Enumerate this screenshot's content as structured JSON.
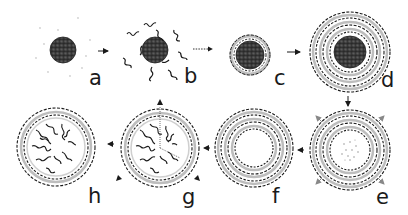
{
  "diagram": {
    "type": "process-sequence",
    "colors": {
      "core": "#3a3a3a",
      "line": "#1a1a1a",
      "light_line": "#9a9a9a",
      "background": "#ffffff"
    },
    "steps": [
      {
        "id": "a",
        "label": "a",
        "state": "bare core particle"
      },
      {
        "id": "b",
        "label": "b",
        "state": "core with free chains"
      },
      {
        "id": "c",
        "label": "c",
        "state": "core with one adsorbed layer"
      },
      {
        "id": "d",
        "label": "d",
        "state": "core with multiple layers"
      },
      {
        "id": "e",
        "label": "e",
        "state": "core dissolving (dotted interior, outward arrows)"
      },
      {
        "id": "f",
        "label": "f",
        "state": "hollow multilayer shell"
      },
      {
        "id": "g",
        "label": "g",
        "state": "shell filled with chains, arrows"
      },
      {
        "id": "h",
        "label": "h",
        "state": "filled capsule"
      }
    ],
    "flow": [
      "a",
      "b",
      "c",
      "d",
      "e",
      "f",
      "g",
      "h"
    ]
  }
}
